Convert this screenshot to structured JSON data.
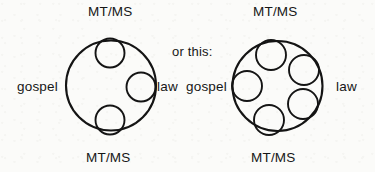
{
  "page": {
    "background_color": "#fbfbf9",
    "ink_color": "#141414",
    "width": 375,
    "height": 172
  },
  "connector": {
    "text": "or this:"
  },
  "diagrams": [
    {
      "id": "left-diagram",
      "label_top": "MT/MS",
      "label_bottom": "MT/MS",
      "label_left": "gospel",
      "label_right": "law",
      "outer_circle": {
        "cx": 111,
        "cy": 85.5,
        "r": 45,
        "stroke_width": 2.1
      },
      "inner_circles": [
        {
          "name": "inner-circle-top",
          "cx": 110,
          "cy": 53,
          "r": 14.5,
          "stroke_width": 1.9
        },
        {
          "name": "inner-circle-mid-right",
          "cx": 141,
          "cy": 87,
          "r": 14.5,
          "stroke_width": 1.9
        },
        {
          "name": "inner-circle-bottom",
          "cx": 110,
          "cy": 120,
          "r": 14.5,
          "stroke_width": 1.9
        }
      ]
    },
    {
      "id": "right-diagram",
      "label_top": "MT/MS",
      "label_bottom": "MT/MS",
      "label_left": "gospel",
      "label_right": "law",
      "outer_circle": {
        "cx": 277.5,
        "cy": 86,
        "r": 45,
        "stroke_width": 2.1
      },
      "inner_circles": [
        {
          "name": "inner-circle-top",
          "cx": 271,
          "cy": 55,
          "r": 15,
          "stroke_width": 1.9
        },
        {
          "name": "inner-circle-upper-right",
          "cx": 304,
          "cy": 70,
          "r": 15,
          "stroke_width": 1.9
        },
        {
          "name": "inner-circle-lower-right",
          "cx": 303,
          "cy": 104,
          "r": 15,
          "stroke_width": 1.9
        },
        {
          "name": "inner-circle-bottom",
          "cx": 269,
          "cy": 120,
          "r": 15,
          "stroke_width": 1.9
        },
        {
          "name": "inner-circle-left",
          "cx": 247,
          "cy": 86,
          "r": 15,
          "stroke_width": 1.9
        }
      ]
    }
  ],
  "labels": {
    "left_top": {
      "text": "MT/MS",
      "x": 88,
      "y": 5
    },
    "left_bottom": {
      "text": "MT/MS",
      "x": 86,
      "y": 151
    },
    "left_gospel": {
      "text": "gospel",
      "x": 17,
      "y": 80
    },
    "left_law": {
      "text": "law",
      "x": 157,
      "y": 80
    },
    "connector": {
      "text": "or this:",
      "x": 172,
      "y": 45
    },
    "right_top": {
      "text": "MT/MS",
      "x": 253,
      "y": 5
    },
    "right_bottom": {
      "text": "MT/MS",
      "x": 251,
      "y": 151
    },
    "right_gospel": {
      "text": "gospel",
      "x": 186,
      "y": 80
    },
    "right_law": {
      "text": "law",
      "x": 336,
      "y": 80
    }
  }
}
